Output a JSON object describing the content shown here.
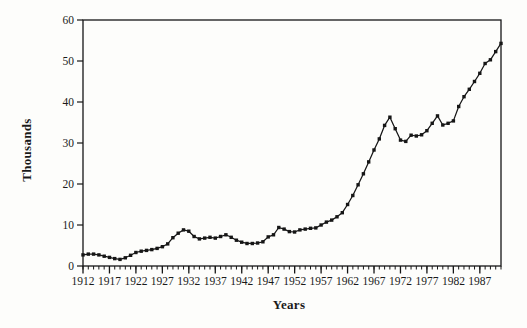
{
  "chart_data": {
    "type": "line",
    "title": "",
    "xlabel": "Years",
    "ylabel": "Thousands",
    "x": [
      1912,
      1913,
      1914,
      1915,
      1916,
      1917,
      1918,
      1919,
      1920,
      1921,
      1922,
      1923,
      1924,
      1925,
      1926,
      1927,
      1928,
      1929,
      1930,
      1931,
      1932,
      1933,
      1934,
      1935,
      1936,
      1937,
      1938,
      1939,
      1940,
      1941,
      1942,
      1943,
      1944,
      1945,
      1946,
      1947,
      1948,
      1949,
      1950,
      1951,
      1952,
      1953,
      1954,
      1955,
      1956,
      1957,
      1958,
      1959,
      1960,
      1961,
      1962,
      1963,
      1964,
      1965,
      1966,
      1967,
      1968,
      1969,
      1970,
      1971,
      1972,
      1973,
      1974,
      1975,
      1976,
      1977,
      1978,
      1979,
      1980,
      1981,
      1982,
      1983,
      1984,
      1985,
      1986,
      1987,
      1988,
      1989,
      1990,
      1991
    ],
    "values": [
      2.7,
      2.9,
      2.9,
      2.7,
      2.4,
      2.1,
      1.8,
      1.6,
      2.0,
      2.6,
      3.3,
      3.6,
      3.8,
      4.0,
      4.3,
      4.7,
      5.4,
      6.9,
      8.0,
      8.8,
      8.5,
      7.2,
      6.6,
      6.8,
      7.0,
      6.8,
      7.2,
      7.6,
      7.0,
      6.3,
      5.8,
      5.5,
      5.5,
      5.6,
      5.9,
      7.1,
      7.6,
      9.4,
      9.0,
      8.4,
      8.3,
      8.8,
      9.0,
      9.2,
      9.3,
      10.0,
      10.7,
      11.2,
      12.0,
      13.0,
      15.0,
      17.2,
      19.8,
      22.5,
      25.4,
      28.3,
      31.0,
      34.3,
      36.3,
      33.5,
      30.7,
      30.4,
      31.9,
      31.7,
      32.0,
      33.0,
      34.8,
      36.6,
      34.4,
      34.8,
      35.4,
      38.9,
      41.3,
      43.1,
      45.0,
      47.0,
      49.4,
      50.3,
      52.3,
      54.3
    ],
    "xlim": [
      1912,
      1991
    ],
    "ylim": [
      0,
      60
    ],
    "xticks": [
      1912,
      1917,
      1922,
      1927,
      1932,
      1937,
      1942,
      1947,
      1952,
      1957,
      1962,
      1967,
      1972,
      1977,
      1982,
      1987
    ],
    "yticks": [
      0,
      10,
      20,
      30,
      40,
      50,
      60
    ],
    "grid": false,
    "legend": null,
    "marker": "square",
    "colors": {
      "line": "#161616",
      "marker": "#161616",
      "axis": "#161616",
      "text": "#1a1a1a",
      "background": "#fdfdfb"
    }
  }
}
